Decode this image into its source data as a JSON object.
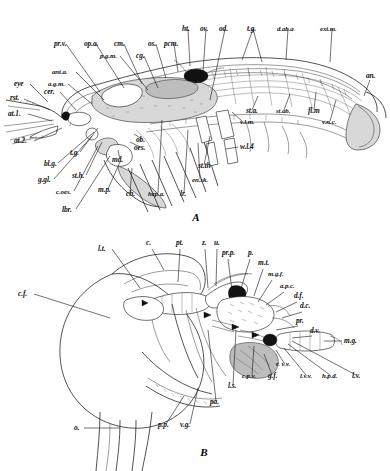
{
  "plate": {
    "background_color": "#ffffff",
    "ink_color": "#111111",
    "figures": [
      {
        "id": "A",
        "caption": "A",
        "subject": "lateral dissection of a decapod crustacean (crayfish / prawn) showing internal anatomy",
        "labels": [
          {
            "key": "eye",
            "text": "eye",
            "x": 14,
            "y": 86,
            "lx": 48,
            "ly": 102
          },
          {
            "key": "rst",
            "text": "rst.",
            "x": 10,
            "y": 100,
            "lx": 50,
            "ly": 110
          },
          {
            "key": "at1",
            "text": "at.1.",
            "x": 8,
            "y": 116,
            "lx": 52,
            "ly": 121
          },
          {
            "key": "at2",
            "text": "at.2.",
            "x": 14,
            "y": 143,
            "lx": 62,
            "ly": 128
          },
          {
            "key": "cer",
            "text": "cer.",
            "x": 44,
            "y": 94,
            "lx": 76,
            "ly": 110
          },
          {
            "key": "agm",
            "text": "a.g.m.",
            "x": 48,
            "y": 86,
            "lx": 92,
            "ly": 104
          },
          {
            "key": "anta",
            "text": "ant.a.",
            "x": 52,
            "y": 74,
            "lx": 104,
            "ly": 100
          },
          {
            "key": "prv",
            "text": "pr.v.",
            "x": 54,
            "y": 46,
            "lx": 100,
            "ly": 92
          },
          {
            "key": "opa",
            "text": "op.a.",
            "x": 84,
            "y": 46,
            "lx": 124,
            "ly": 88
          },
          {
            "key": "cm",
            "text": "cm.",
            "x": 114,
            "y": 46,
            "lx": 142,
            "ly": 84
          },
          {
            "key": "pgm",
            "text": "p.g.m.",
            "x": 100,
            "y": 58,
            "lx": 148,
            "ly": 90
          },
          {
            "key": "cg",
            "text": "cg.",
            "x": 136,
            "y": 58,
            "lx": 158,
            "ly": 88
          },
          {
            "key": "os",
            "text": "os.",
            "x": 148,
            "y": 46,
            "lx": 166,
            "ly": 78
          },
          {
            "key": "pcm",
            "text": "pcm.",
            "x": 164,
            "y": 46,
            "lx": 178,
            "ly": 72
          },
          {
            "key": "ht",
            "text": "ht.",
            "x": 182,
            "y": 31,
            "lx": 190,
            "ly": 66
          },
          {
            "key": "ov",
            "text": "ov.",
            "x": 200,
            "y": 31,
            "lx": 203,
            "ly": 72
          },
          {
            "key": "od",
            "text": "od.",
            "x": 219,
            "y": 31,
            "lx": 210,
            "ly": 100
          },
          {
            "key": "tg_top",
            "text": "t.g.",
            "x": 247,
            "y": 31,
            "lx": 246,
            "ly": 62
          },
          {
            "key": "daba",
            "text": "d.ab.a",
            "x": 277,
            "y": 31,
            "lx": 286,
            "ly": 60
          },
          {
            "key": "extm",
            "text": "ext.m.",
            "x": 320,
            "y": 31,
            "lx": 330,
            "ly": 62
          },
          {
            "key": "an",
            "text": "an.",
            "x": 366,
            "y": 78,
            "lx": 364,
            "ly": 96
          },
          {
            "key": "sta",
            "text": "st.a.",
            "x": 246,
            "y": 113,
            "lx": 256,
            "ly": 96
          },
          {
            "key": "stab",
            "text": "st.ab.",
            "x": 276,
            "y": 113,
            "lx": 288,
            "ly": 94
          },
          {
            "key": "flm",
            "text": "fl.m",
            "x": 308,
            "y": 113,
            "lx": 314,
            "ly": 92
          },
          {
            "key": "vlm",
            "text": "v.l.m.",
            "x": 240,
            "y": 124,
            "lx": 234,
            "ly": 112
          },
          {
            "key": "vnc",
            "text": "v.n.c.",
            "x": 322,
            "y": 124,
            "lx": 334,
            "ly": 100
          },
          {
            "key": "wl4",
            "text": "w.l.4",
            "x": 240,
            "y": 149,
            "lx": 228,
            "ly": 150
          },
          {
            "key": "stth",
            "text": "st.th",
            "x": 198,
            "y": 168,
            "lx": 208,
            "ly": 136
          },
          {
            "key": "ensk",
            "text": "en.sk.",
            "x": 192,
            "y": 182,
            "lx": 196,
            "ly": 142
          },
          {
            "key": "lr",
            "text": "lr.",
            "x": 180,
            "y": 196,
            "lx": 186,
            "ly": 130
          },
          {
            "key": "hepa",
            "text": "hep.a.",
            "x": 148,
            "y": 196,
            "lx": 160,
            "ly": 120
          },
          {
            "key": "ch",
            "text": "ch.",
            "x": 126,
            "y": 196,
            "lx": 130,
            "ly": 168
          },
          {
            "key": "mp",
            "text": "m.p.",
            "x": 98,
            "y": 192,
            "lx": 118,
            "ly": 162
          },
          {
            "key": "coes",
            "text": "c.oes.",
            "x": 56,
            "y": 194,
            "lx": 96,
            "ly": 146
          },
          {
            "key": "ggl",
            "text": "g.gl.",
            "x": 38,
            "y": 182,
            "lx": 90,
            "ly": 136
          },
          {
            "key": "sth",
            "text": "st.h.",
            "x": 72,
            "y": 178,
            "lx": 100,
            "ly": 142
          },
          {
            "key": "blg",
            "text": "bl.g.",
            "x": 44,
            "y": 166,
            "lx": 92,
            "ly": 132
          },
          {
            "key": "tg_low",
            "text": "t.g.",
            "x": 70,
            "y": 155,
            "lx": 96,
            "ly": 128
          },
          {
            "key": "md",
            "text": "md.",
            "x": 112,
            "y": 162,
            "lx": 116,
            "ly": 150
          },
          {
            "key": "oes",
            "text": "oes.",
            "x": 134,
            "y": 150,
            "lx": 128,
            "ly": 142
          },
          {
            "key": "ob",
            "text": "ob.",
            "x": 136,
            "y": 142,
            "lx": 132,
            "ly": 134
          },
          {
            "key": "lbr",
            "text": "lbr.",
            "x": 62,
            "y": 212,
            "lx": 108,
            "ly": 156
          }
        ]
      },
      {
        "id": "B",
        "caption": "B",
        "subject": "lateral view of the cephalothorax region showing vascular and glandular structures",
        "labels": [
          {
            "key": "lt",
            "text": "l.t.",
            "x": 98,
            "y": 251,
            "lx": 140,
            "ly": 288
          },
          {
            "key": "c",
            "text": "c.",
            "x": 146,
            "y": 245,
            "lx": 164,
            "ly": 270
          },
          {
            "key": "pt",
            "text": "pt.",
            "x": 176,
            "y": 245,
            "lx": 178,
            "ly": 282
          },
          {
            "key": "z",
            "text": "z.",
            "x": 202,
            "y": 245,
            "lx": 208,
            "ly": 288
          },
          {
            "key": "u",
            "text": "u.",
            "x": 214,
            "y": 245,
            "lx": 216,
            "ly": 286
          },
          {
            "key": "prp",
            "text": "pr.p.",
            "x": 222,
            "y": 255,
            "lx": 232,
            "ly": 290
          },
          {
            "key": "p",
            "text": "p.",
            "x": 248,
            "y": 255,
            "lx": 240,
            "ly": 292
          },
          {
            "key": "mt",
            "text": "m.t.",
            "x": 258,
            "y": 265,
            "lx": 254,
            "ly": 296
          },
          {
            "key": "mgf",
            "text": "m.g.f.",
            "x": 268,
            "y": 276,
            "lx": 258,
            "ly": 302
          },
          {
            "key": "apc",
            "text": "a.p.c.",
            "x": 280,
            "y": 288,
            "lx": 266,
            "ly": 305
          },
          {
            "key": "df",
            "text": "d.f.",
            "x": 294,
            "y": 298,
            "lx": 276,
            "ly": 312
          },
          {
            "key": "dc",
            "text": "d.c.",
            "x": 300,
            "y": 308,
            "lx": 282,
            "ly": 318
          },
          {
            "key": "pr",
            "text": "pr.",
            "x": 296,
            "y": 323,
            "lx": 276,
            "ly": 330
          },
          {
            "key": "dv",
            "text": "d.v.",
            "x": 310,
            "y": 333,
            "lx": 292,
            "ly": 338
          },
          {
            "key": "mg",
            "text": "m.g.",
            "x": 344,
            "y": 343,
            "lx": 322,
            "ly": 343
          },
          {
            "key": "cf",
            "text": "c.f.",
            "x": 18,
            "y": 296,
            "lx": 110,
            "ly": 318
          },
          {
            "key": "o",
            "text": "o.",
            "x": 74,
            "y": 430,
            "lx": 118,
            "ly": 430
          },
          {
            "key": "pp",
            "text": "p.p.",
            "x": 158,
            "y": 427,
            "lx": 182,
            "ly": 396
          },
          {
            "key": "vg",
            "text": "v.g.",
            "x": 180,
            "y": 427,
            "lx": 196,
            "ly": 388
          },
          {
            "key": "pa",
            "text": "pa.",
            "x": 210,
            "y": 404,
            "lx": 208,
            "ly": 330
          },
          {
            "key": "ls",
            "text": "l.s.",
            "x": 228,
            "y": 388,
            "lx": 234,
            "ly": 330
          },
          {
            "key": "cpv",
            "text": "c.p.v.",
            "x": 242,
            "y": 378,
            "lx": 252,
            "ly": 344
          },
          {
            "key": "gf",
            "text": "g.f.",
            "x": 268,
            "y": 378,
            "lx": 262,
            "ly": 352
          },
          {
            "key": "rvv",
            "text": "r. v.v.",
            "x": 276,
            "y": 366,
            "lx": 274,
            "ly": 350
          },
          {
            "key": "lvv",
            "text": "l.v.v.",
            "x": 300,
            "y": 378,
            "lx": 282,
            "ly": 348
          },
          {
            "key": "hpd",
            "text": "h.p.d.",
            "x": 322,
            "y": 378,
            "lx": 286,
            "ly": 344
          },
          {
            "key": "lv",
            "text": "l.v.",
            "x": 352,
            "y": 378,
            "lx": 290,
            "ly": 341
          }
        ]
      }
    ]
  }
}
